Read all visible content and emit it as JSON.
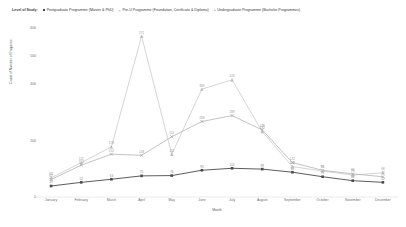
{
  "legend": {
    "title": "Level of Study:",
    "items": [
      {
        "label": "Postgraduate Programme (Master & PhD)",
        "marker": "square-marker",
        "color": "#4a4a4a"
      },
      {
        "label": "Pre-U Programme (Foundation, Certificate & Diploma)",
        "marker": "x-marker",
        "color": "#9a9a9a"
      },
      {
        "label": "Undergraduate Programme (Bachelor Programmes)",
        "marker": "triangle-marker",
        "color": "#b9b9b9"
      }
    ]
  },
  "chart_data": {
    "type": "line",
    "title": "",
    "xlabel": "Month",
    "ylabel": "Count of Number of Enquiries",
    "categories": [
      "January",
      "February",
      "March",
      "April",
      "May",
      "June",
      "July",
      "August",
      "September",
      "October",
      "November",
      "December"
    ],
    "ylim": [
      0,
      600
    ],
    "yticks": [
      0,
      200,
      400,
      500,
      600
    ],
    "ytick_labels": [
      "0",
      "200",
      "400",
      "500",
      "600"
    ],
    "grid": false,
    "legend_position": "top",
    "series": [
      {
        "name": "Postgraduate Programme (Master & PhD)",
        "color": "#4a4a4a",
        "marker": "square",
        "values": [
          39,
          52,
          63,
          75,
          76,
          95,
          102,
          99,
          88,
          72,
          58,
          52
        ],
        "labels": [
          "39",
          "52",
          "63",
          "75",
          "76",
          "95",
          "102",
          "99",
          "88",
          "72",
          "58",
          "52"
        ]
      },
      {
        "name": "Pre-U Programme (Foundation, Certificate & Diploma)",
        "color": "#9a9a9a",
        "marker": "x",
        "values": [
          62,
          113,
          152,
          148,
          214,
          268,
          289,
          238,
          122,
          95,
          82,
          72
        ],
        "labels": [
          "62",
          "113",
          "152",
          "148",
          "214",
          "268",
          "289",
          "238",
          "122",
          "95",
          "82",
          "72"
        ]
      },
      {
        "name": "Undergraduate Programme (Bachelor Programmes)",
        "color": "#b9b9b9",
        "marker": "triangle",
        "values": [
          68,
          122,
          178,
          571,
          152,
          383,
          416,
          232,
          108,
          92,
          78,
          86
        ],
        "labels": [
          "68",
          "122",
          "178",
          "571",
          "152",
          "383",
          "416",
          "232",
          "108",
          "92",
          "78",
          "86"
        ]
      }
    ]
  }
}
